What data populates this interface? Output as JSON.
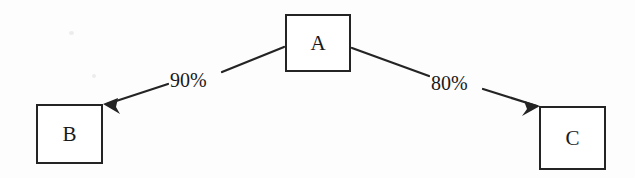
{
  "diagram": {
    "type": "directed-graph",
    "title": "",
    "background_color": "#fdfdfd",
    "stroke_color": "#242424",
    "text_color": "#1a1a1a",
    "nodes": [
      {
        "id": "A",
        "label": "A"
      },
      {
        "id": "B",
        "label": "B"
      },
      {
        "id": "C",
        "label": "C"
      }
    ],
    "edges": [
      {
        "from": "A",
        "to": "B",
        "label": "90%",
        "direction": "down-left",
        "arrowhead": "B"
      },
      {
        "from": "A",
        "to": "C",
        "label": "80%",
        "direction": "down-right",
        "arrowhead": "C"
      }
    ]
  }
}
